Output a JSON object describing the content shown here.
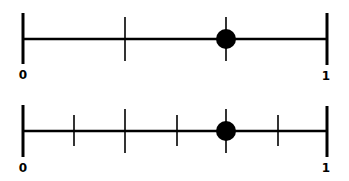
{
  "diagram": {
    "colors": {
      "line": "#000000",
      "dot": "#000000",
      "background": "#ffffff"
    },
    "number_lines": [
      {
        "id": "top",
        "start_label": "0",
        "end_label": "1",
        "divisions": 2,
        "tick_positions": [
          0.5
        ],
        "point_position": 0.5,
        "point_note": "dot at the tick between 0 and 1"
      },
      {
        "id": "bottom",
        "start_label": "0",
        "end_label": "1",
        "divisions": 6,
        "tick_positions": [
          0.1667,
          0.3333,
          0.5,
          0.6667,
          0.8333
        ],
        "point_position": 0.6667,
        "point_note": "dot at the fourth tick"
      }
    ]
  }
}
